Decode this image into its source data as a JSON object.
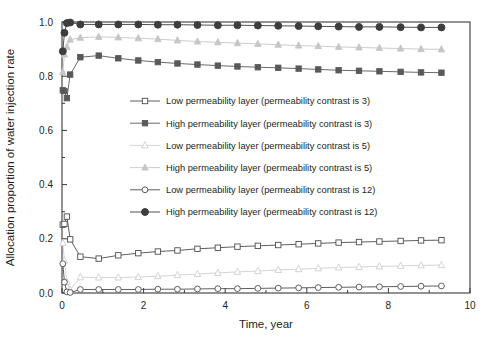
{
  "chart_data": {
    "type": "line",
    "title": "",
    "xlabel": "Time, year",
    "ylabel": "Allocation proportion of water injection rate",
    "xlim": [
      0,
      10
    ],
    "ylim": [
      0.0,
      1.0
    ],
    "xticks": [
      0,
      2,
      4,
      6,
      8,
      10
    ],
    "xticklabels": [
      "0",
      "2",
      "4",
      "6",
      "8",
      "10"
    ],
    "yticks": [
      0.0,
      0.2,
      0.4,
      0.6,
      0.8,
      1.0
    ],
    "yticklabels": [
      "0.0",
      "0.2",
      "0.4",
      "0.6",
      "0.8",
      "1.0"
    ],
    "grid": false,
    "legend_position": "center-left-inside",
    "series": [
      {
        "name": "Low permeability layer (permeability contrast is 3)",
        "marker": "open-square",
        "color": "#4d4d4d",
        "fill": "#ffffff",
        "x": [
          0.02,
          0.06,
          0.12,
          0.2,
          0.45,
          0.9,
          1.38,
          1.87,
          2.35,
          2.83,
          3.32,
          3.82,
          4.3,
          4.8,
          5.3,
          5.8,
          6.28,
          6.78,
          7.28,
          7.78,
          8.3,
          8.8,
          9.3
        ],
        "y": [
          0.252,
          0.255,
          0.282,
          0.198,
          0.134,
          0.127,
          0.139,
          0.147,
          0.153,
          0.157,
          0.163,
          0.167,
          0.171,
          0.174,
          0.177,
          0.18,
          0.183,
          0.186,
          0.188,
          0.19,
          0.192,
          0.194,
          0.195
        ]
      },
      {
        "name": "High permeability layer (permeability contrast is 3)",
        "marker": "filled-square",
        "color": "#595959",
        "fill": "#595959",
        "x": [
          0.02,
          0.06,
          0.12,
          0.2,
          0.45,
          0.9,
          1.38,
          1.87,
          2.35,
          2.83,
          3.32,
          3.82,
          4.3,
          4.8,
          5.3,
          5.8,
          6.28,
          6.78,
          7.28,
          7.78,
          8.3,
          8.8,
          9.3
        ],
        "y": [
          0.748,
          0.745,
          0.719,
          0.806,
          0.87,
          0.876,
          0.866,
          0.858,
          0.852,
          0.847,
          0.843,
          0.839,
          0.836,
          0.833,
          0.831,
          0.828,
          0.825,
          0.822,
          0.82,
          0.818,
          0.816,
          0.814,
          0.813
        ]
      },
      {
        "name": "Low permeability layer (permeability contrast is 5)",
        "marker": "open-triangle",
        "color": "#cfcfcf",
        "fill": "#ffffff",
        "x": [
          0.02,
          0.06,
          0.12,
          0.2,
          0.45,
          0.9,
          1.38,
          1.87,
          2.35,
          2.83,
          3.32,
          3.82,
          4.3,
          4.8,
          5.3,
          5.8,
          6.28,
          6.78,
          7.28,
          7.78,
          8.3,
          8.8,
          9.3
        ],
        "y": [
          0.185,
          0.12,
          0.04,
          0.012,
          0.058,
          0.057,
          0.057,
          0.059,
          0.062,
          0.066,
          0.07,
          0.074,
          0.078,
          0.081,
          0.085,
          0.088,
          0.091,
          0.094,
          0.096,
          0.098,
          0.1,
          0.102,
          0.103
        ]
      },
      {
        "name": "High permeability layer (permeability contrast is 5)",
        "marker": "filled-triangle",
        "color": "#c6c6c6",
        "fill": "#c6c6c6",
        "x": [
          0.02,
          0.06,
          0.12,
          0.2,
          0.45,
          0.9,
          1.38,
          1.87,
          2.35,
          2.83,
          3.32,
          3.82,
          4.3,
          4.8,
          5.3,
          5.8,
          6.28,
          6.78,
          7.28,
          7.78,
          8.3,
          8.8,
          9.3
        ],
        "y": [
          0.815,
          0.88,
          0.908,
          0.935,
          0.942,
          0.945,
          0.943,
          0.94,
          0.937,
          0.932,
          0.928,
          0.925,
          0.922,
          0.919,
          0.916,
          0.913,
          0.911,
          0.908,
          0.906,
          0.904,
          0.902,
          0.9,
          0.899
        ]
      },
      {
        "name": "Low permeability layer (permeability contrast is 12)",
        "marker": "open-circle",
        "color": "#4d4d4d",
        "fill": "#ffffff",
        "x": [
          0.02,
          0.06,
          0.12,
          0.2,
          0.45,
          0.9,
          1.38,
          1.87,
          2.35,
          2.83,
          3.32,
          3.82,
          4.3,
          4.8,
          5.3,
          5.8,
          6.28,
          6.78,
          7.28,
          7.78,
          8.3,
          8.8,
          9.3
        ],
        "y": [
          0.108,
          0.04,
          0.004,
          0.002,
          0.013,
          0.013,
          0.013,
          0.013,
          0.014,
          0.014,
          0.015,
          0.016,
          0.016,
          0.017,
          0.018,
          0.019,
          0.02,
          0.021,
          0.022,
          0.023,
          0.024,
          0.025,
          0.026
        ]
      },
      {
        "name": "High permeability layer (permeability contrast is 12)",
        "marker": "filled-circle",
        "color": "#3d3d3d",
        "fill": "#3d3d3d",
        "x": [
          0.02,
          0.06,
          0.12,
          0.2,
          0.45,
          0.9,
          1.38,
          1.87,
          2.35,
          2.83,
          3.32,
          3.82,
          4.3,
          4.8,
          5.3,
          5.8,
          6.28,
          6.78,
          7.28,
          7.78,
          8.3,
          8.8,
          9.3
        ],
        "y": [
          0.892,
          0.96,
          0.996,
          0.998,
          0.991,
          0.991,
          0.991,
          0.991,
          0.99,
          0.99,
          0.989,
          0.988,
          0.988,
          0.987,
          0.986,
          0.985,
          0.984,
          0.983,
          0.982,
          0.982,
          0.981,
          0.98,
          0.98
        ]
      }
    ]
  },
  "legend": {
    "items": [
      {
        "label": "Low permeability layer (permeability contrast is 3)",
        "marker": "open-square",
        "color": "#4d4d4d",
        "fill": "#ffffff"
      },
      {
        "label": "High permeability layer (permeability contrast is 3)",
        "marker": "filled-square",
        "color": "#595959",
        "fill": "#595959"
      },
      {
        "label": "Low permeability layer (permeability contrast is 5)",
        "marker": "open-triangle",
        "color": "#cfcfcf",
        "fill": "#ffffff"
      },
      {
        "label": "High permeability layer (permeability contrast is 5)",
        "marker": "filled-triangle",
        "color": "#c6c6c6",
        "fill": "#c6c6c6"
      },
      {
        "label": "Low permeability layer (permeability contrast is 12)",
        "marker": "open-circle",
        "color": "#4d4d4d",
        "fill": "#ffffff"
      },
      {
        "label": "High permeability layer (permeability contrast is 12)",
        "marker": "filled-circle",
        "color": "#3d3d3d",
        "fill": "#3d3d3d"
      }
    ]
  },
  "style": {
    "axis_color": "#3a3a3a",
    "text_color": "#231f20",
    "background": "#ffffff"
  }
}
